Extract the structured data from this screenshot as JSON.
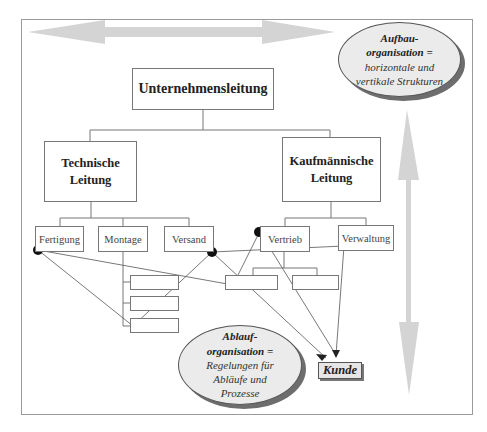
{
  "diagram": {
    "top_management": "Unternehmensleitung",
    "divisions": [
      {
        "label_line1": "Technische",
        "label_line2": "Leitung",
        "departments": [
          "Fertigung",
          "Montage",
          "Versand"
        ]
      },
      {
        "label_line1": "Kaufmännische",
        "label_line2": "Leitung",
        "departments": [
          "Vertrieb",
          "Verwaltung"
        ]
      }
    ],
    "aufbau": {
      "title_line1": "Aufbau-",
      "title_line2": "organisation =",
      "desc_line1": "horizontale und",
      "desc_line2": "vertikale Strukturen"
    },
    "ablauf": {
      "title_line1": "Ablauf-",
      "title_line2": "organisation =",
      "desc_line1": "Regelungen für",
      "desc_line2": "Abläufe und",
      "desc_line3": "Prozesse"
    },
    "customer": "Kunde",
    "colors": {
      "arrow": "#d4d4d4",
      "ellipse_fill": "#ebebeb",
      "ellipse_shadow": "#6d6d6d",
      "node_dot": "#111111",
      "lines": "#777777"
    }
  }
}
